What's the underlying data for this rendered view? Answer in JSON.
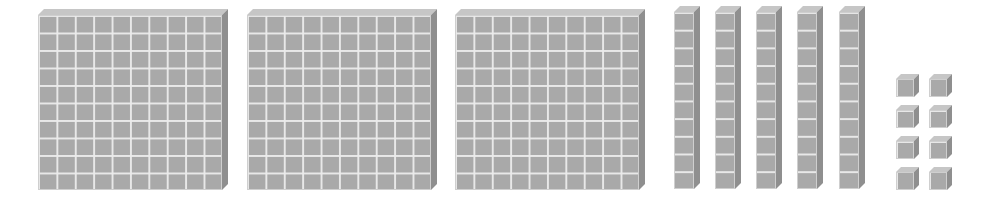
{
  "diagram": {
    "type": "base-ten-blocks",
    "represented_number": 358,
    "colors": {
      "front": "#a9a9a9",
      "top": "#c6c6c6",
      "side": "#8f8f8f",
      "grid_line": "#ebebeb",
      "background": "#ffffff"
    },
    "groups": [
      {
        "name": "hundreds-flats",
        "count": 3,
        "unit_value": 100,
        "grid": [
          10,
          10
        ]
      },
      {
        "name": "tens-rods",
        "count": 5,
        "unit_value": 10,
        "grid": [
          1,
          10
        ]
      },
      {
        "name": "ones-units",
        "count": 8,
        "unit_value": 1,
        "grid": [
          1,
          1
        ]
      }
    ],
    "flats": [
      {
        "x": 38,
        "y": 15,
        "w": 184,
        "h": 175
      },
      {
        "x": 247,
        "y": 15,
        "w": 184,
        "h": 175
      },
      {
        "x": 455,
        "y": 15,
        "w": 184,
        "h": 175
      }
    ],
    "rods": [
      {
        "x": 674,
        "y": 12,
        "w": 20,
        "h": 177
      },
      {
        "x": 715,
        "y": 12,
        "w": 20,
        "h": 177
      },
      {
        "x": 756,
        "y": 12,
        "w": 20,
        "h": 177
      },
      {
        "x": 797,
        "y": 12,
        "w": 20,
        "h": 177
      },
      {
        "x": 839,
        "y": 12,
        "w": 20,
        "h": 177
      }
    ],
    "units": [
      {
        "x": 896,
        "y": 79
      },
      {
        "x": 929,
        "y": 79
      },
      {
        "x": 896,
        "y": 110
      },
      {
        "x": 929,
        "y": 110
      },
      {
        "x": 896,
        "y": 141
      },
      {
        "x": 929,
        "y": 141
      },
      {
        "x": 896,
        "y": 172
      },
      {
        "x": 929,
        "y": 172
      }
    ]
  }
}
